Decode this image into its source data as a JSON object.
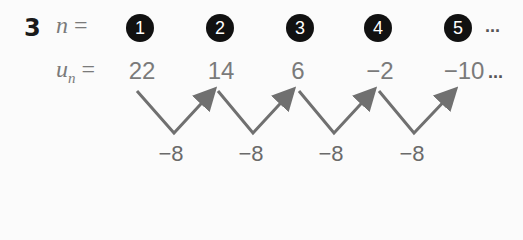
{
  "question_number": "3",
  "n_label": "n",
  "u_label": "u",
  "u_sub": "n",
  "equals": " =",
  "n_values": [
    "1",
    "2",
    "3",
    "4",
    "5"
  ],
  "ellipsis": "...",
  "terms": [
    "22",
    "14",
    "6",
    "−2",
    "−10"
  ],
  "differences": [
    "−8",
    "−8",
    "−8",
    "−8"
  ],
  "arrow_color": "#707070"
}
